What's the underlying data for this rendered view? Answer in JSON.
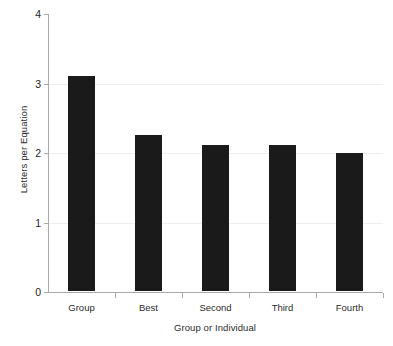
{
  "chart_data": {
    "type": "bar",
    "title": "",
    "subtitle": "",
    "xlabel": "Group or Individual",
    "ylabel": "Letters per Equation",
    "categories": [
      "Group",
      "Best",
      "Second",
      "Third",
      "Fourth"
    ],
    "values": [
      3.1,
      2.24,
      2.1,
      2.1,
      1.98
    ],
    "ylim": [
      0,
      4
    ],
    "yticks": [
      0,
      1,
      2,
      3,
      4
    ],
    "ytick_labels": [
      "0",
      "1",
      "2",
      "3",
      "4"
    ],
    "grid": true,
    "gridlines_at": [
      1,
      2,
      3
    ],
    "legend": null,
    "legend_position": "none",
    "bar_color": "#1a1a1a",
    "axis_color": "#a7a9ac",
    "grid_color": "#efefef",
    "background": "#ffffff"
  }
}
